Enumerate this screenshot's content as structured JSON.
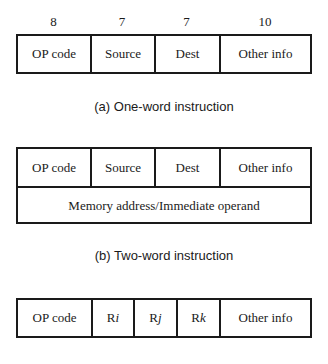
{
  "diagram_a": {
    "bit_widths": [
      "8",
      "7",
      "7",
      "10"
    ],
    "fields": [
      "OP code",
      "Source",
      "Dest",
      "Other info"
    ],
    "caption": "(a) One-word instruction"
  },
  "diagram_b": {
    "fields": [
      "OP code",
      "Source",
      "Dest",
      "Other info"
    ],
    "second_word": "Memory address/Immediate operand",
    "caption": "(b) Two-word instruction"
  },
  "diagram_c": {
    "fields": [
      {
        "prefix": "OP code",
        "suffix": ""
      },
      {
        "prefix": "R",
        "suffix": "i"
      },
      {
        "prefix": "R",
        "suffix": "j"
      },
      {
        "prefix": "R",
        "suffix": "k"
      },
      {
        "prefix": "Other info",
        "suffix": ""
      }
    ]
  }
}
